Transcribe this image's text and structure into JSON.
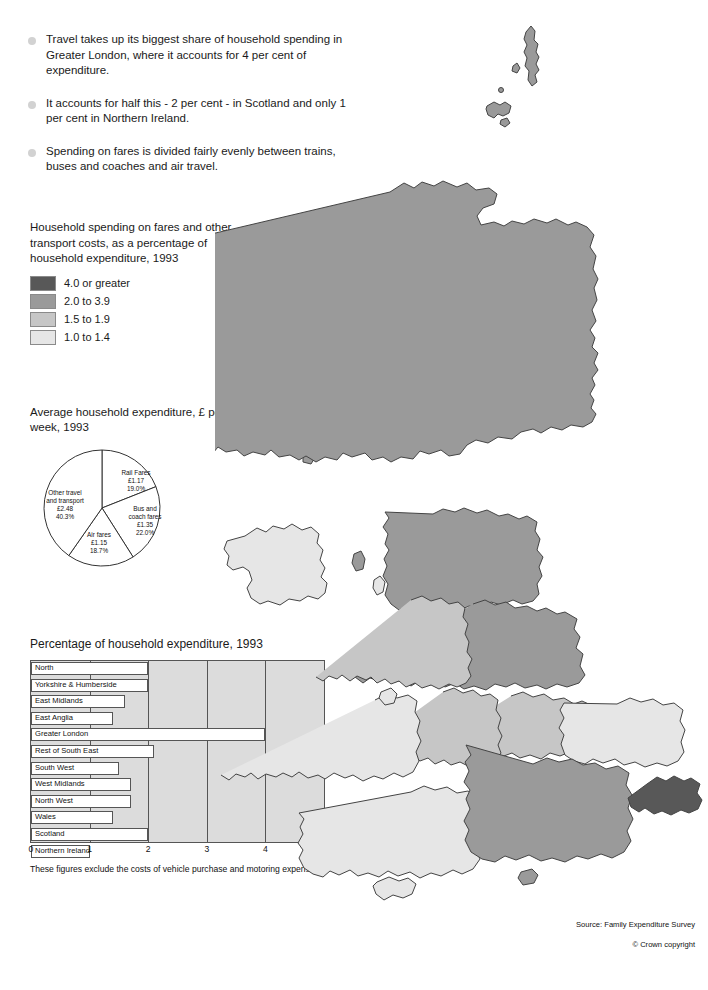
{
  "bullets": [
    "Travel takes up its biggest share of household spending in Greater London, where it accounts for 4 per cent of expenditure.",
    "It accounts for half this - 2 per cent - in Scotland and only 1 per cent in Northern Ireland.",
    "Spending on fares is divided fairly evenly between trains, buses and coaches and air travel."
  ],
  "legend": {
    "title": "Household spending on fares and other transport costs, as a percentage of household expenditure, 1993",
    "items": [
      {
        "label": "4.0 or greater",
        "color": "#585858"
      },
      {
        "label": "2.0 to 3.9",
        "color": "#9a9a9a"
      },
      {
        "label": "1.5 to 1.9",
        "color": "#c6c6c6"
      },
      {
        "label": "1.0 to 1.4",
        "color": "#e6e6e6"
      }
    ]
  },
  "chart_data": [
    {
      "type": "pie",
      "title": "Average household expenditure, £ per week, 1993",
      "categories": [
        "Rail Fares",
        "Bus and coach fares",
        "Air fares",
        "Other travel and transport"
      ],
      "values": [
        19.0,
        22.0,
        18.7,
        40.3
      ],
      "slices": [
        {
          "name": "Rail Fares",
          "amount": "£1.17",
          "percent": "19.0%",
          "value": 19.0
        },
        {
          "name": "Bus and coach fares",
          "amount": "£1.35",
          "percent": "22.0%",
          "value": 22.0
        },
        {
          "name": "Air fares",
          "amount": "£1.15",
          "percent": "18.7%",
          "value": 18.7
        },
        {
          "name": "Other travel and transport",
          "amount": "£2.48",
          "percent": "40.3%",
          "value": 40.3
        }
      ],
      "ylabel": "",
      "xlabel": "",
      "legend": "none"
    },
    {
      "type": "bar",
      "title": "Percentage of household expenditure, 1993",
      "orientation": "horizontal",
      "categories": [
        "North",
        "Yorkshire & Humberside",
        "East Midlands",
        "East Anglia",
        "Greater London",
        "Rest of South East",
        "South West",
        "West Midlands",
        "North West",
        "Wales",
        "Scotland",
        "Northern Ireland"
      ],
      "values": [
        2.0,
        2.0,
        1.6,
        1.4,
        4.0,
        2.1,
        1.5,
        1.7,
        1.7,
        1.4,
        2.0,
        1.0
      ],
      "xlim": [
        0,
        5
      ],
      "ticks": [
        "0",
        "1",
        "2",
        "3",
        "4",
        "5"
      ],
      "grid": true,
      "xlabel": "",
      "ylabel": "",
      "footnote": "These figures exclude the costs of vehicle purchase and motoring expenses."
    }
  ],
  "pie_title": "Average household expenditure, £ per week, 1993",
  "bar_title": "Percentage of household expenditure, 1993",
  "footnote": "These figures exclude the costs of vehicle purchase and motoring expenses.",
  "source": {
    "survey": "Source: Family Expenditure Survey",
    "copyright": "© Crown copyright"
  },
  "map": {
    "regions": [
      {
        "name": "Scotland",
        "band": "2.0 to 3.9",
        "color": "#9a9a9a"
      },
      {
        "name": "Northern Ireland",
        "band": "1.0 to 1.4",
        "color": "#e6e6e6"
      },
      {
        "name": "North",
        "band": "2.0 to 3.9",
        "color": "#9a9a9a"
      },
      {
        "name": "Yorkshire & Humberside",
        "band": "2.0 to 3.9",
        "color": "#9a9a9a"
      },
      {
        "name": "North West",
        "band": "1.5 to 1.9",
        "color": "#c6c6c6"
      },
      {
        "name": "East Midlands",
        "band": "1.5 to 1.9",
        "color": "#c6c6c6"
      },
      {
        "name": "West Midlands",
        "band": "1.5 to 1.9",
        "color": "#c6c6c6"
      },
      {
        "name": "East Anglia",
        "band": "1.0 to 1.4",
        "color": "#e6e6e6"
      },
      {
        "name": "Wales",
        "band": "1.0 to 1.4",
        "color": "#e6e6e6"
      },
      {
        "name": "South West",
        "band": "1.0 to 1.4",
        "color": "#e6e6e6"
      },
      {
        "name": "Rest of South East",
        "band": "2.0 to 3.9",
        "color": "#9a9a9a"
      },
      {
        "name": "Greater London",
        "band": "4.0 or greater",
        "color": "#585858"
      }
    ]
  }
}
